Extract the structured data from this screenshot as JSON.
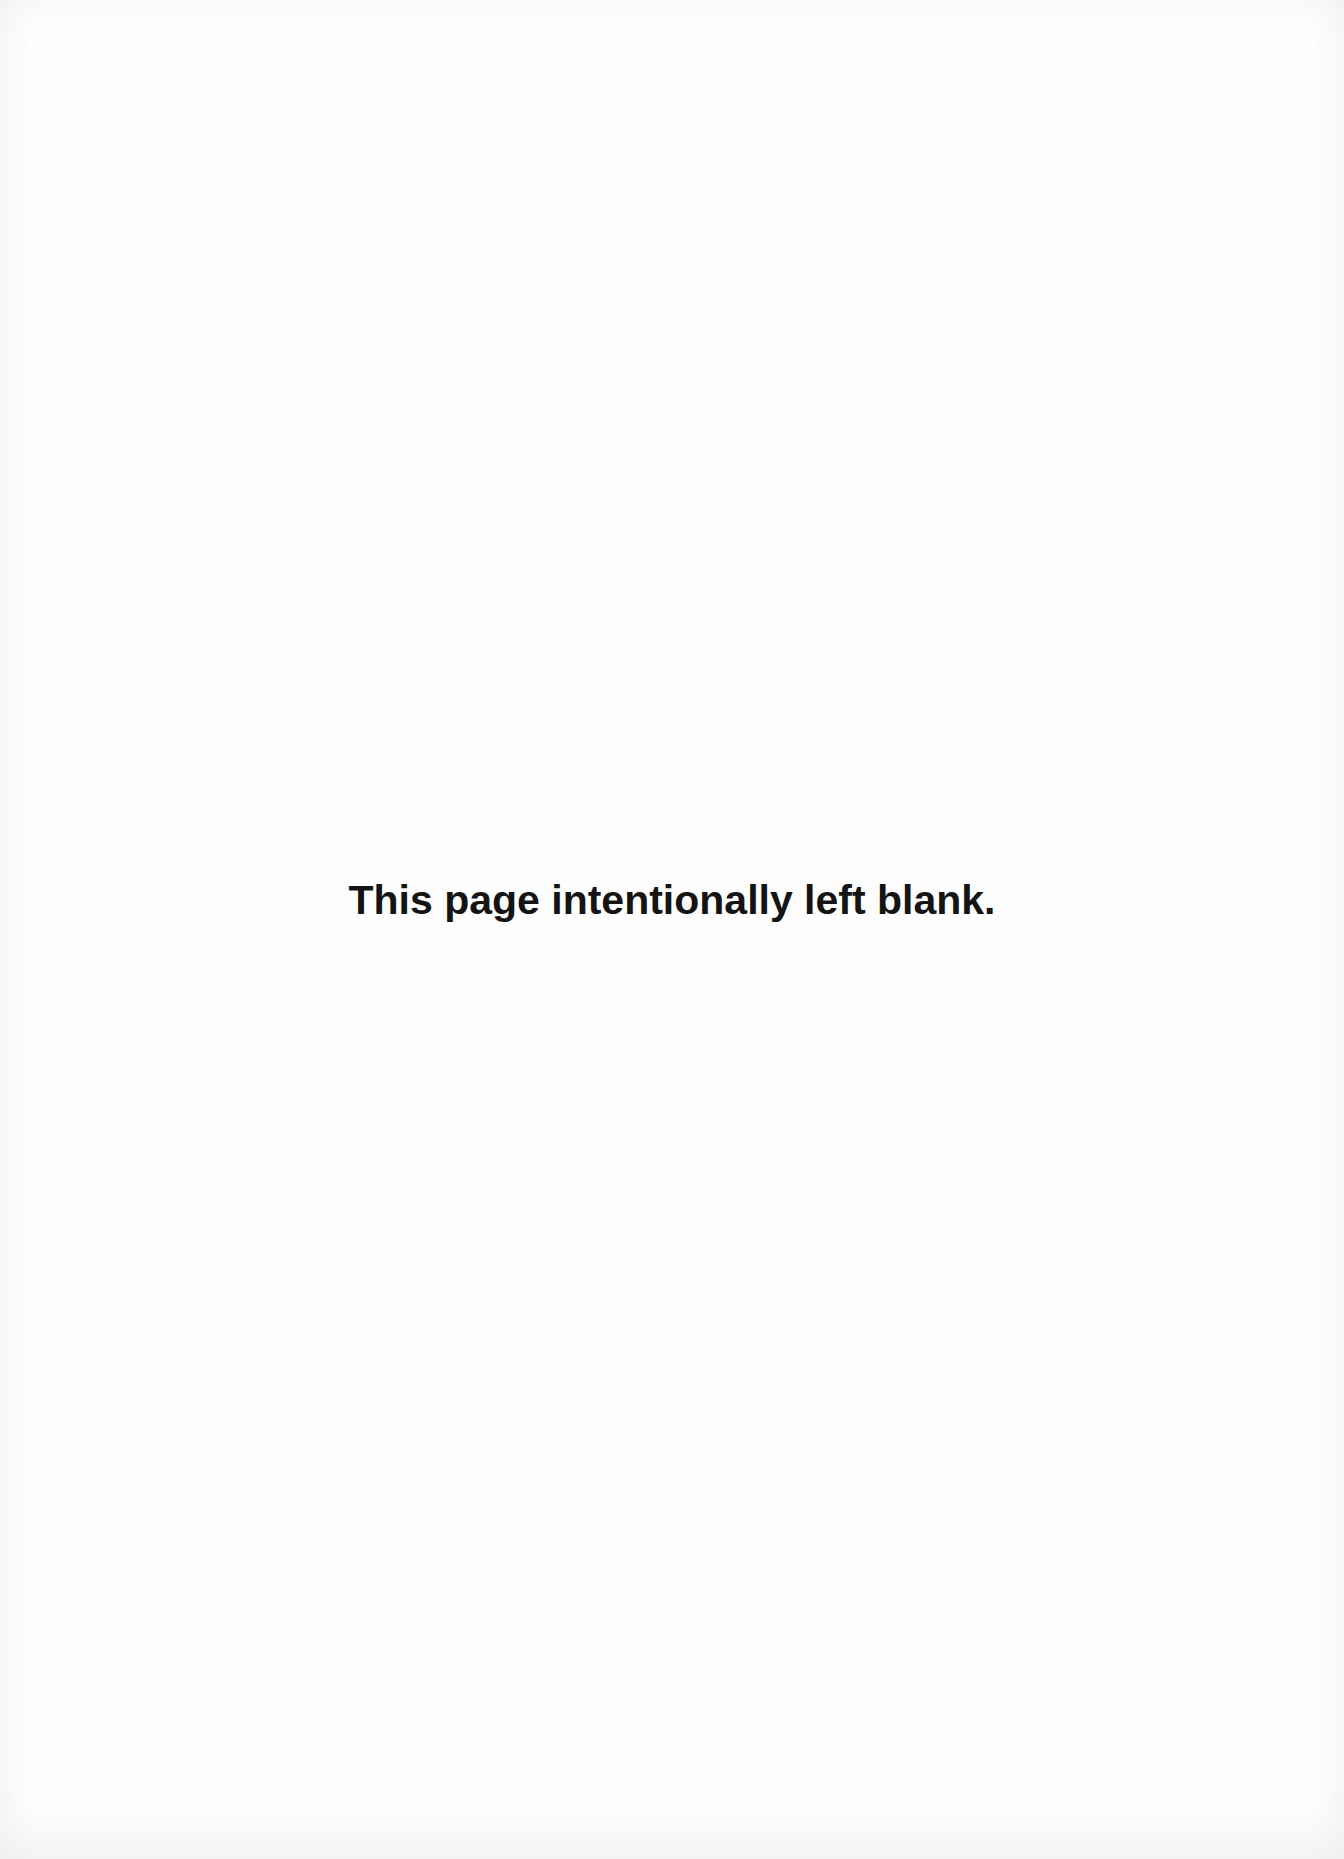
{
  "page": {
    "message": "This page intentionally left blank."
  }
}
